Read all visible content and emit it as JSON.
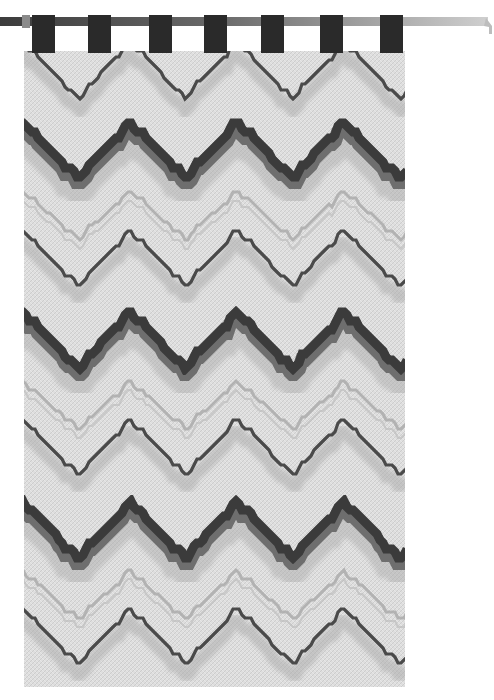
{
  "image": {
    "subject": "Bargello flame-stitch needlepoint wall hanging on a rod",
    "palette": {
      "background": "#ffffff",
      "fabric_base": "#dcdcdc",
      "fabric_light": "#ededed",
      "flame_dark": "#3a3a3a",
      "flame_mid": "#6e6e6e",
      "flame_soft": "#a8a8a8",
      "tab": "#2a2a2a",
      "rod_dark": "#3c3c3c",
      "rod_light": "#c8c8c8"
    },
    "rod": {
      "x1": 0,
      "x2": 490,
      "y": 22,
      "thickness": 9
    },
    "tabs": [
      {
        "x": 32,
        "w": 23
      },
      {
        "x": 88,
        "w": 23
      },
      {
        "x": 149,
        "w": 23
      },
      {
        "x": 204,
        "w": 23
      },
      {
        "x": 261,
        "w": 23
      },
      {
        "x": 320,
        "w": 23
      },
      {
        "x": 380,
        "w": 23
      }
    ],
    "panel": {
      "x": 24,
      "y": 51,
      "w": 381,
      "h": 636
    },
    "wave": {
      "period": 107,
      "phase_x": 24,
      "amplitude": 28
    },
    "bands": [
      {
        "type": "thin-dark",
        "y": 70
      },
      {
        "type": "flame-dark",
        "y": 150
      },
      {
        "type": "thin-soft",
        "y": 215
      },
      {
        "type": "thin-dark",
        "y": 258
      },
      {
        "type": "flame-dark",
        "y": 340
      },
      {
        "type": "thin-soft",
        "y": 405
      },
      {
        "type": "thin-dark",
        "y": 447
      },
      {
        "type": "flame-dark",
        "y": 530
      },
      {
        "type": "thin-soft",
        "y": 595
      },
      {
        "type": "thin-dark",
        "y": 636
      }
    ]
  }
}
